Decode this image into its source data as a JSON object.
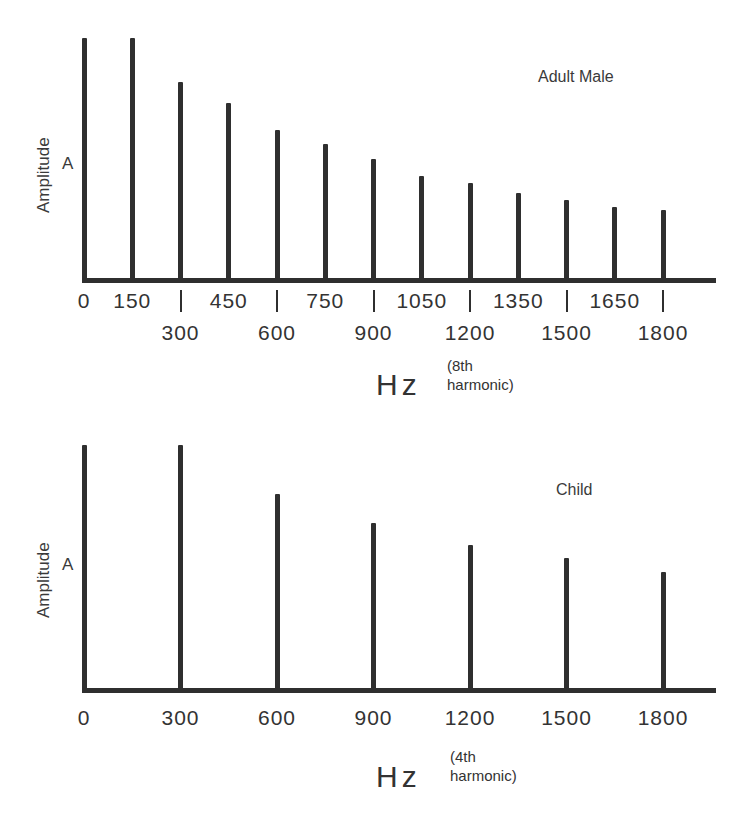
{
  "chart_data": [
    {
      "type": "bar",
      "title": "Adult Male",
      "xlabel": "Hz",
      "xlabel_note": "(8th\nharmonic)",
      "ylabel": "Amplitude",
      "ysymbol": "A",
      "grid": false,
      "ylim": [
        0,
        100
      ],
      "x": [
        0,
        150,
        300,
        450,
        600,
        750,
        900,
        1050,
        1200,
        1350,
        1500,
        1650,
        1800
      ],
      "values": [
        100,
        100,
        82,
        73,
        62,
        56,
        50,
        43,
        40,
        36,
        33,
        30,
        29
      ],
      "tick_labels_row1": [
        "0",
        "150",
        "450",
        "750",
        "1050",
        "1350",
        "1650"
      ],
      "tick_labels_row2": [
        "300",
        "600",
        "900",
        "1200",
        "1500",
        "1800"
      ],
      "fundamental_hz": 150,
      "note": "Relative line-spectrum amplitudes; tallest component normalized to 100"
    },
    {
      "type": "bar",
      "title": "Child",
      "xlabel": "Hz",
      "xlabel_note": "(4th\nharmonic)",
      "ylabel": "Amplitude",
      "ysymbol": "A",
      "grid": false,
      "ylim": [
        0,
        100
      ],
      "x": [
        0,
        300,
        600,
        900,
        1200,
        1500,
        1800
      ],
      "values": [
        100,
        100,
        80,
        68,
        59,
        54,
        48
      ],
      "tick_labels": [
        "0",
        "300",
        "600",
        "900",
        "1200",
        "1500",
        "1800"
      ],
      "fundamental_hz": 300,
      "note": "Relative line-spectrum amplitudes; tallest component normalized to 100"
    }
  ],
  "top": {
    "title": "Adult Male",
    "ylabel": "Amplitude",
    "ysymbol": "A",
    "xlabel": "Hz",
    "xlabel_note": "(8th\nharmonic)",
    "row1": [
      "0",
      "150",
      "450",
      "750",
      "1050",
      "1350",
      "1650"
    ],
    "row2": [
      "300",
      "600",
      "900",
      "1200",
      "1500",
      "1800"
    ]
  },
  "bottom": {
    "title": "Child",
    "ylabel": "Amplitude",
    "ysymbol": "A",
    "xlabel": "Hz",
    "xlabel_note": "(4th\nharmonic)",
    "ticks": [
      "0",
      "300",
      "600",
      "900",
      "1200",
      "1500",
      "1800"
    ]
  },
  "colors": {
    "ink": "#2f2f2f",
    "text": "#333333",
    "background": "#ffffff"
  }
}
